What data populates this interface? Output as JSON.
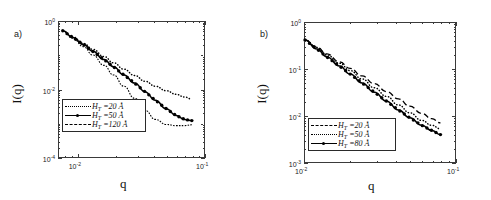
{
  "figure": {
    "panels": [
      {
        "tag": "a)",
        "xlabel": "q",
        "ylabel": "I(q)",
        "yticks": [
          "10",
          "10",
          "10"
        ],
        "ytick_exps": [
          "0",
          "-2",
          "-4"
        ],
        "xticks": [
          "10",
          "10"
        ],
        "xtick_exps": [
          "-2",
          "-1"
        ],
        "legend": [
          {
            "symbol": "H",
            "sub": "T",
            "eq": " =20 Å",
            "style": "dotted"
          },
          {
            "symbol": "H",
            "sub": "T",
            "eq": " =50 Å",
            "style": "solid-markers"
          },
          {
            "symbol": "H",
            "sub": "T",
            "eq": " =120 Å",
            "style": "fine-dashed"
          }
        ]
      },
      {
        "tag": "b)",
        "xlabel": "q",
        "ylabel": "I(q)",
        "yticks": [
          "10",
          "10",
          "10",
          "10"
        ],
        "ytick_exps": [
          "0",
          "-1",
          "-2",
          "-3"
        ],
        "xticks": [
          "10",
          "10"
        ],
        "xtick_exps": [
          "-2",
          "-1"
        ],
        "legend": [
          {
            "symbol": "H",
            "sub": "T",
            "eq": " =20 Å",
            "style": "dashed"
          },
          {
            "symbol": "H",
            "sub": "T",
            "eq": " =50 Å",
            "style": "dotted"
          },
          {
            "symbol": "H",
            "sub": "T",
            "eq": " =80 Å",
            "style": "solid-markers"
          }
        ]
      }
    ]
  },
  "chart_data": [
    {
      "type": "line",
      "title": "",
      "panel": "a)",
      "xlabel": "q",
      "ylabel": "I(q)",
      "xscale": "log",
      "yscale": "log",
      "xlim": [
        0.007,
        0.1
      ],
      "ylim": [
        0.0001,
        1.0
      ],
      "xticks": [
        0.01,
        0.1
      ],
      "yticks": [
        1.0,
        0.01,
        0.0001
      ],
      "grid": false,
      "legend_position": "lower-left-inside",
      "series": [
        {
          "name": "H_T =20 Å",
          "style": "dotted",
          "x": [
            0.0075,
            0.009,
            0.011,
            0.013,
            0.016,
            0.019,
            0.023,
            0.028,
            0.034,
            0.041,
            0.05,
            0.06,
            0.07,
            0.08
          ],
          "y": [
            0.55,
            0.36,
            0.23,
            0.155,
            0.095,
            0.062,
            0.04,
            0.026,
            0.0175,
            0.0125,
            0.0092,
            0.0072,
            0.006,
            0.0052
          ]
        },
        {
          "name": "H_T =50 Å",
          "style": "solid-markers",
          "x": [
            0.0075,
            0.009,
            0.011,
            0.013,
            0.016,
            0.019,
            0.023,
            0.028,
            0.034,
            0.041,
            0.05,
            0.06,
            0.07,
            0.08
          ],
          "y": [
            0.55,
            0.35,
            0.215,
            0.135,
            0.077,
            0.047,
            0.027,
            0.0155,
            0.0085,
            0.0048,
            0.0027,
            0.0017,
            0.0013,
            0.0012
          ]
        },
        {
          "name": "H_T =120 Å",
          "style": "fine-dashed",
          "x": [
            0.0075,
            0.009,
            0.011,
            0.013,
            0.016,
            0.019,
            0.023,
            0.028,
            0.034,
            0.041,
            0.05,
            0.06,
            0.07,
            0.08
          ],
          "y": [
            0.55,
            0.33,
            0.185,
            0.105,
            0.052,
            0.027,
            0.0125,
            0.0055,
            0.0024,
            0.0013,
            0.00092,
            0.00085,
            0.00085,
            0.0009
          ]
        }
      ]
    },
    {
      "type": "line",
      "title": "",
      "panel": "b)",
      "xlabel": "q",
      "ylabel": "I(q)",
      "xscale": "log",
      "yscale": "log",
      "xlim": [
        0.01,
        0.1
      ],
      "ylim": [
        0.001,
        1.0
      ],
      "xticks": [
        0.01,
        0.1
      ],
      "yticks": [
        1.0,
        0.1,
        0.01,
        0.001
      ],
      "grid": false,
      "legend_position": "lower-left-inside",
      "series": [
        {
          "name": "H_T =20 Å",
          "style": "dashed",
          "x": [
            0.01,
            0.012,
            0.014,
            0.017,
            0.02,
            0.024,
            0.029,
            0.035,
            0.042,
            0.05,
            0.06,
            0.07,
            0.08
          ],
          "y": [
            0.43,
            0.3,
            0.215,
            0.145,
            0.105,
            0.072,
            0.049,
            0.033,
            0.023,
            0.016,
            0.0112,
            0.0086,
            0.007
          ]
        },
        {
          "name": "H_T =50 Å",
          "style": "dotted",
          "x": [
            0.01,
            0.012,
            0.014,
            0.017,
            0.02,
            0.024,
            0.029,
            0.035,
            0.042,
            0.05,
            0.06,
            0.07,
            0.08
          ],
          "y": [
            0.43,
            0.295,
            0.205,
            0.135,
            0.094,
            0.062,
            0.04,
            0.026,
            0.017,
            0.0115,
            0.0079,
            0.0062,
            0.0052
          ]
        },
        {
          "name": "H_T =80 Å",
          "style": "solid-markers",
          "x": [
            0.01,
            0.012,
            0.014,
            0.017,
            0.02,
            0.024,
            0.029,
            0.035,
            0.042,
            0.05,
            0.06,
            0.07,
            0.08
          ],
          "y": [
            0.43,
            0.275,
            0.185,
            0.118,
            0.079,
            0.051,
            0.032,
            0.0205,
            0.0132,
            0.009,
            0.0062,
            0.0048,
            0.0039
          ]
        }
      ]
    }
  ]
}
